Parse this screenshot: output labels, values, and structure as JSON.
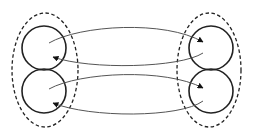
{
  "diagram": {
    "colors": {
      "stroke": "#222222",
      "line": "#555555",
      "background": "#ffffff"
    },
    "groups": [
      {
        "id": "left-group",
        "cx": 45,
        "cy": 70,
        "rx": 33,
        "ry": 57,
        "nodes": [
          {
            "id": "left-top",
            "cx": 44,
            "cy": 48,
            "r": 22
          },
          {
            "id": "left-bottom",
            "cx": 44,
            "cy": 91,
            "r": 22
          }
        ]
      },
      {
        "id": "right-group",
        "cx": 209,
        "cy": 70,
        "rx": 32,
        "ry": 57,
        "nodes": [
          {
            "id": "right-top",
            "cx": 211,
            "cy": 48,
            "r": 22
          },
          {
            "id": "right-bottom",
            "cx": 211,
            "cy": 91,
            "r": 22
          }
        ]
      }
    ],
    "edges": [
      {
        "from": "left-top",
        "to": "right-top"
      },
      {
        "from": "right-top",
        "to": "left-top"
      },
      {
        "from": "left-bottom",
        "to": "right-bottom"
      },
      {
        "from": "right-bottom",
        "to": "left-bottom"
      }
    ]
  }
}
